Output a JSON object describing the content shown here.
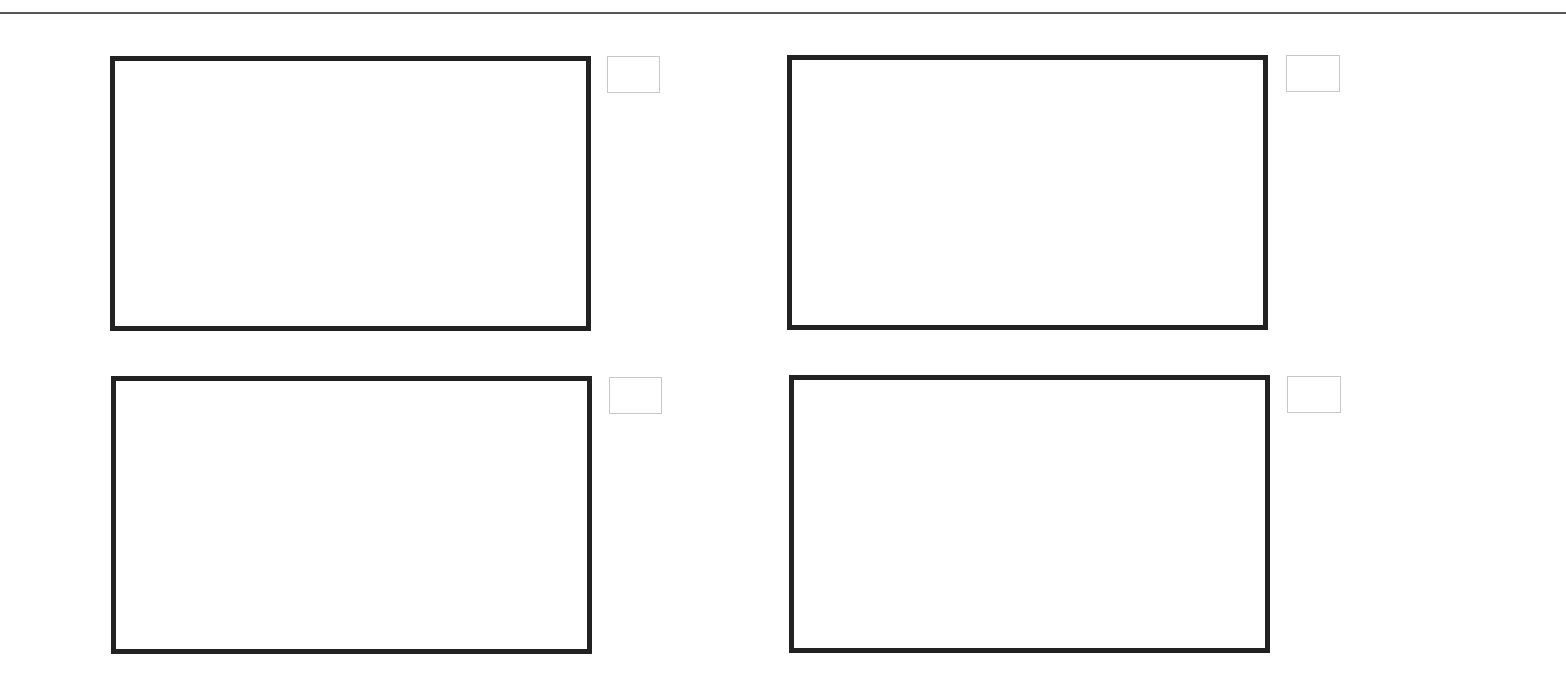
{
  "header": {
    "rule_color": "#555555"
  },
  "panels": [
    {
      "id": "panel-1",
      "position": "top-left",
      "frame_border_color": "#222222",
      "indicator_checked": false
    },
    {
      "id": "panel-2",
      "position": "top-right",
      "frame_border_color": "#222222",
      "indicator_checked": false
    },
    {
      "id": "panel-3",
      "position": "bottom-left",
      "frame_border_color": "#222222",
      "indicator_checked": false
    },
    {
      "id": "panel-4",
      "position": "bottom-right",
      "frame_border_color": "#222222",
      "indicator_checked": false
    }
  ],
  "colors": {
    "background": "#ffffff",
    "frame_border": "#222222",
    "indicator_border": "#c8c8c8"
  }
}
